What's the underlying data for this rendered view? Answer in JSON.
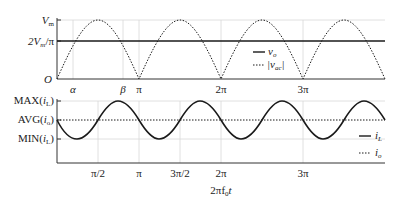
{
  "top_plot": {
    "y_labels": {
      "vm": "V",
      "vm_sub": "m",
      "two_vm_pi_a": "2V",
      "two_vm_pi_sub": "m",
      "two_vm_pi_b": "/π",
      "origin": "O"
    },
    "x_labels": {
      "alpha": "α",
      "beta": "β",
      "pi": "π",
      "two_pi": "2π",
      "three_pi": "3π"
    },
    "legend": [
      {
        "style": "solid",
        "label": "v",
        "sub": "o"
      },
      {
        "style": "dotted",
        "label": "|v",
        "sub": "ac",
        "suffix": "|"
      }
    ]
  },
  "bottom_plot": {
    "y_labels": {
      "max_a": "MAX(",
      "max_i": "i",
      "max_sub": "L",
      "max_b": ")",
      "avg_a": "AVG(",
      "avg_i": "i",
      "avg_sub": "o",
      "avg_b": ")",
      "min_a": "MIN(",
      "min_i": "i",
      "min_sub": "L",
      "min_b": ")"
    },
    "x_labels": {
      "pi_half": "π/2",
      "pi": "π",
      "three_pi_half": "3π/2",
      "two_pi": "2π",
      "three_pi": "3π"
    },
    "x_axis_title": "2πf",
    "x_axis_title_sub": "0",
    "x_axis_title_suffix": "t",
    "legend": [
      {
        "style": "solid",
        "label": "i",
        "sub": "L"
      },
      {
        "style": "dotted",
        "label": "i",
        "sub": "o"
      }
    ]
  },
  "colors": {
    "line": "#1a1a1a",
    "grid": "#d8d8d8",
    "axis": "#333333"
  }
}
